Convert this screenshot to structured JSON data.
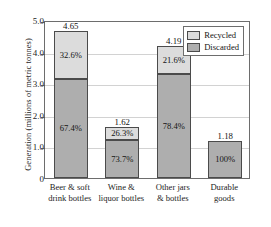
{
  "chart_data": {
    "type": "bar",
    "subtype": "stacked",
    "title": "",
    "xlabel": "",
    "ylabel": "Generation (millions of metric tonnes)",
    "ylim": [
      0,
      5.0
    ],
    "yticks": [
      "0",
      "1.0",
      "2.0",
      "3.0",
      "4.0",
      "5.0"
    ],
    "ytick_values": [
      0,
      1.0,
      2.0,
      3.0,
      4.0,
      5.0
    ],
    "grid": true,
    "grid_axis": "y",
    "legend_position": "top-right",
    "categories": [
      "Beer & soft drink bottles",
      "Wine & liquor bottles",
      "Other jars & bottles",
      "Durable goods"
    ],
    "category_lines": [
      [
        "Beer & soft",
        "drink bottles"
      ],
      [
        "Wine &",
        "liquor bottles"
      ],
      [
        "Other jars",
        "& bottles"
      ],
      [
        "Durable",
        "goods"
      ]
    ],
    "totals": [
      4.65,
      1.62,
      4.19,
      1.18
    ],
    "total_labels": [
      "4.65",
      "1.62",
      "4.19",
      "1.18"
    ],
    "series": [
      {
        "name": "Recycled",
        "color": "#dcdcdc",
        "values": [
          1.52,
          0.43,
          0.9,
          0.0
        ],
        "percent_labels": [
          "32.6%",
          "26.3%",
          "21.6%",
          ""
        ]
      },
      {
        "name": "Discarded",
        "color": "#aeaeae",
        "values": [
          3.13,
          1.19,
          3.29,
          1.18
        ],
        "percent_labels": [
          "67.4%",
          "73.7%",
          "78.4%",
          "100%"
        ]
      }
    ]
  },
  "legend": {
    "items": [
      {
        "label": "Recycled",
        "color": "#dcdcdc"
      },
      {
        "label": "Discarded",
        "color": "#aeaeae"
      }
    ]
  },
  "colors": {
    "recycled": "#dcdcdc",
    "discarded": "#aeaeae",
    "frame": "#6d6d6d",
    "gridline": "#d2d2d2",
    "bar_outline": "#4b4b4b",
    "background": "#ffffff"
  }
}
